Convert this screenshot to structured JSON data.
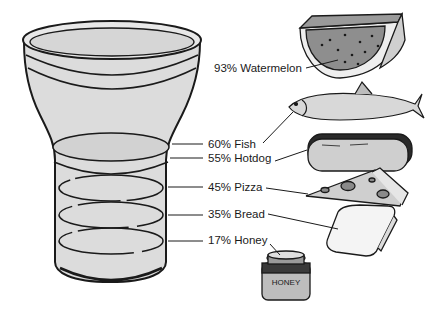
{
  "diagram": {
    "container": "glass-cup",
    "items": [
      {
        "percent": 93,
        "food": "Watermelon",
        "label": "93% Watermelon"
      },
      {
        "percent": 60,
        "food": "Fish",
        "label": "60% Fish"
      },
      {
        "percent": 55,
        "food": "Hotdog",
        "label": "55% Hotdog"
      },
      {
        "percent": 45,
        "food": "Pizza",
        "label": "45% Pizza"
      },
      {
        "percent": 35,
        "food": "Bread",
        "label": "35% Bread"
      },
      {
        "percent": 17,
        "food": "Honey",
        "label": "17% Honey"
      }
    ],
    "jar_text": "HONEY"
  },
  "colors": {
    "fill": "#d9d9d9",
    "stroke": "#1a1a1a",
    "watermelon_flesh": "#8a8a8a",
    "dark": "#3a3a3a"
  }
}
